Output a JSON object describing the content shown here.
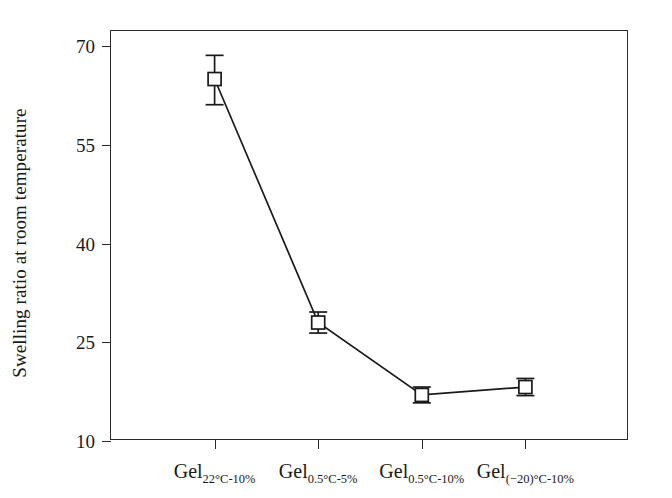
{
  "chart_data": {
    "type": "line",
    "title": "",
    "subtitle": "",
    "xlabel": "",
    "ylabel": "Swelling ratio at room temperature",
    "categories": [
      "Gel_22°C-10%",
      "Gel_0.5°C-5%",
      "Gel_0.5°C-10%",
      "Gel_(−20)°C-10%"
    ],
    "category_parts": [
      {
        "base": "Gel",
        "sub": "22°C-10%"
      },
      {
        "base": "Gel",
        "sub": "0.5°C-5%"
      },
      {
        "base": "Gel",
        "sub": "0.5°C-10%"
      },
      {
        "base": "Gel",
        "sub": "(−20)°C-10%"
      }
    ],
    "values": [
      65,
      28,
      17,
      18.2
    ],
    "error_lower": [
      3.9,
      1.6,
      1.2,
      1.3
    ],
    "error_upper": [
      3.6,
      1.6,
      1.2,
      1.3
    ],
    "series": [
      {
        "name": "Swelling ratio",
        "values": [
          65,
          28,
          17,
          18.2
        ],
        "marker": "open-square",
        "color": "#1a1a1a",
        "line_color": "#1a1a1a"
      }
    ],
    "yticks": [
      10,
      25,
      40,
      55,
      70
    ],
    "ytick_labels": [
      "10",
      "25",
      "40",
      "55",
      "70"
    ],
    "ylim": [
      10,
      72.3
    ],
    "xlim": [
      0,
      5
    ],
    "grid": false,
    "legend": false,
    "legend_position": "none",
    "frame": "box",
    "annotations": []
  },
  "colors": {
    "ink": "#1a1a1a",
    "axis": "#2b2b2b",
    "background": "#ffffff",
    "marker_fill": "#ffffff"
  }
}
